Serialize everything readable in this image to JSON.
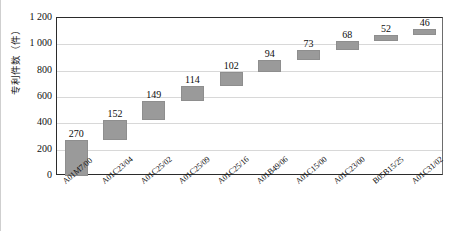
{
  "chart_data": {
    "type": "bar",
    "subtype": "waterfall",
    "title": "",
    "xlabel": "",
    "ylabel": "专利件数（件）",
    "ylim": [
      0,
      1200
    ],
    "ytick_labels": [
      "1 200",
      "1 000",
      "800",
      "600",
      "400",
      "200",
      "0"
    ],
    "ytick_values": [
      1200,
      1000,
      800,
      600,
      400,
      200,
      0
    ],
    "grid": true,
    "legend": "none",
    "categories": [
      "A01M7/00",
      "A01C23/04",
      "A01C25/02",
      "A01C25/09",
      "A01C25/16",
      "A01B49/06",
      "A01C15/00",
      "A01C23/00",
      "B05B15/25",
      "A01C31/02"
    ],
    "values": [
      270,
      152,
      149,
      114,
      102,
      94,
      73,
      68,
      52,
      46
    ],
    "bases": [
      0,
      270,
      422,
      571,
      685,
      787,
      881,
      954,
      1022,
      1074
    ],
    "cumulative": [
      270,
      422,
      571,
      685,
      787,
      881,
      954,
      1022,
      1074,
      1120
    ],
    "data_labels": [
      "270",
      "152",
      "149",
      "114",
      "102",
      "94",
      "73",
      "68",
      "52",
      "46"
    ],
    "bar_color": "#9a9a9a",
    "gridline_color": "#d8d8d8",
    "axis_color": "#2b2b2b"
  }
}
